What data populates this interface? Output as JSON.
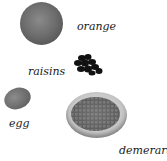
{
  "items": [
    {
      "id": "orange",
      "label": "orange",
      "icon": "orange-icon"
    },
    {
      "id": "raisins",
      "label": "raisins",
      "icon": "raisins-icon"
    },
    {
      "id": "egg",
      "label": "egg",
      "icon": "egg-icon"
    },
    {
      "id": "demerara",
      "label": "demerara",
      "icon": "sugar-bowl-icon"
    }
  ],
  "colors": {
    "background": "#ffffff",
    "text": "#1a1a1a",
    "item_fill": "#6e6e6e"
  }
}
